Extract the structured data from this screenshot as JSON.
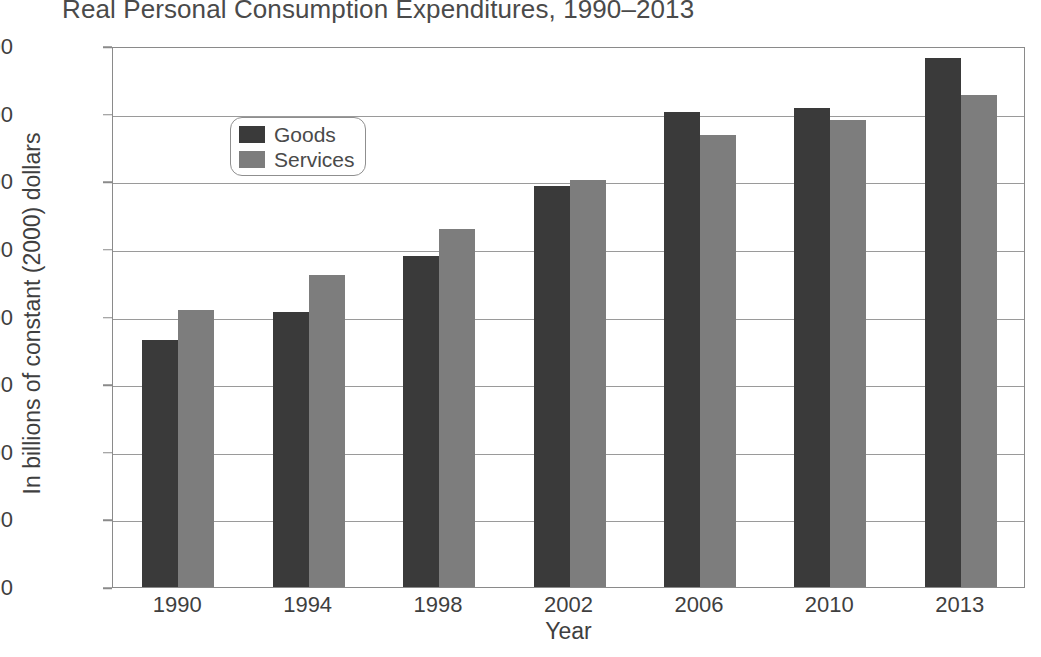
{
  "chart_data": {
    "type": "bar",
    "title": "Real Personal Consumption Expenditures, 1990–2013",
    "xlabel": "Year",
    "ylabel": "In billions of constant (2000) dollars",
    "categories": [
      "1990",
      "1994",
      "1998",
      "2002",
      "2006",
      "2010",
      "2013"
    ],
    "series": [
      {
        "name": "Goods",
        "color": "#3a3a3a",
        "values": [
          3650,
          4060,
          4900,
          5930,
          7030,
          7080,
          7820
        ]
      },
      {
        "name": "Services",
        "color": "#7d7d7d",
        "values": [
          4100,
          4620,
          5300,
          6020,
          6680,
          6910,
          7280
        ]
      }
    ],
    "ylim": [
      0,
      8000
    ],
    "y_ticks": [
      0,
      1000,
      2000,
      3000,
      4000,
      5000,
      6000,
      7000,
      8000
    ],
    "y_tick_labels": [
      "0",
      "1,000",
      "2,000",
      "3,000",
      "4,000",
      "5,000",
      "6,000",
      "7,000",
      "8,000"
    ],
    "grid": true,
    "legend_position": "top-left"
  }
}
